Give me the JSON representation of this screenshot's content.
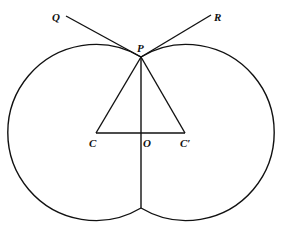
{
  "diagram": {
    "type": "geometry",
    "stroke_color": "#111111",
    "background": "#ffffff",
    "labels": {
      "Q": "Q",
      "R": "R",
      "P": "P",
      "C": "C",
      "O": "O",
      "C_prime": "C′"
    },
    "points": {
      "P": [
        141,
        57
      ],
      "C": [
        96,
        133
      ],
      "C_prime": [
        185,
        133
      ],
      "O": [
        141,
        133
      ],
      "Q": [
        66,
        16
      ],
      "R": [
        211,
        15
      ],
      "bottom_cusp": [
        141,
        208
      ]
    },
    "radius": 88
  }
}
